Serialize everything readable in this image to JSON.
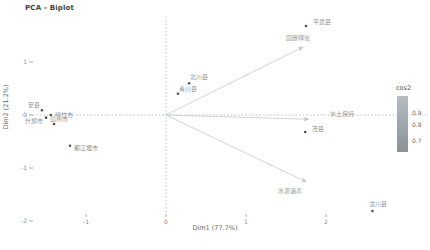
{
  "chart_data": {
    "type": "scatter",
    "subtype": "pca-biplot",
    "title": "PCA - Biplot",
    "xlabel": "Dim1 (77.7%)",
    "ylabel": "Dim2 (21.2%)",
    "xlim": [
      -1.9,
      3.3
    ],
    "ylim": [
      -2.1,
      2.0
    ],
    "x_ticks": [
      -1,
      0,
      1,
      2
    ],
    "y_ticks": [
      1,
      0,
      -1,
      -2
    ],
    "grid": "dotted zero reference lines only",
    "points": [
      {
        "label": "安县",
        "x": -1.55,
        "y": 0.09,
        "dx": -2,
        "dy": -3,
        "anchor": "end"
      },
      {
        "label": "绵竹市",
        "x": -1.44,
        "y": 0.0,
        "dx": 4,
        "dy": 2,
        "anchor": "start"
      },
      {
        "label": "什邡市",
        "x": -1.5,
        "y": -0.05,
        "dx": -3,
        "dy": 5,
        "anchor": "end"
      },
      {
        "label": "彭州市",
        "x": -1.4,
        "y": -0.17,
        "dx": -4,
        "dy": -3,
        "anchor": "start"
      },
      {
        "label": "都江堰市",
        "x": -1.2,
        "y": -0.58,
        "dx": 4,
        "dy": 4,
        "anchor": "start"
      },
      {
        "label": "青川县",
        "x": 0.15,
        "y": 0.4,
        "dx": 1,
        "dy": -3,
        "anchor": "start"
      },
      {
        "label": "北川县",
        "x": 0.29,
        "y": 0.6,
        "dx": 1,
        "dy": -4,
        "anchor": "start"
      },
      {
        "label": "平武县",
        "x": 1.75,
        "y": 1.68,
        "dx": 7,
        "dy": -2,
        "anchor": "start"
      },
      {
        "label": "茂县",
        "x": 1.74,
        "y": -0.32,
        "dx": 7,
        "dy": -1,
        "anchor": "start"
      },
      {
        "label": "汶川县",
        "x": 2.58,
        "y": -1.81,
        "dx": -3,
        "dy": -5,
        "anchor": "start"
      }
    ],
    "arrows": [
      {
        "label": "固碳释氧",
        "x": 1.71,
        "y": 1.28,
        "dx": -5,
        "dy": -7,
        "anchor": "middle"
      },
      {
        "label": "水土保持",
        "x": 1.78,
        "y": -0.08,
        "dx": 22,
        "dy": -3,
        "anchor": "start"
      },
      {
        "label": "水源涵养",
        "x": 1.75,
        "y": -1.26,
        "dx": -16,
        "dy": 11,
        "anchor": "middle"
      }
    ],
    "legend": {
      "title": "cos2",
      "tick_labels": [
        "0.9",
        "0.8",
        "0.7"
      ],
      "position": "right"
    }
  },
  "colors": {
    "title_text": "#3f3f3f",
    "axis_text": "#8a8a8a",
    "dashed_line": "#9b9b9b",
    "point": "#4f4f4f",
    "point_label": "#8f8f8f",
    "arrow": "#c5c9cc",
    "arrow_label": "#9aa0a4",
    "legend_text": "#6f6f6f",
    "legend_gradient_top": "#b6bcc2",
    "legend_gradient_bottom": "#8a9199"
  }
}
